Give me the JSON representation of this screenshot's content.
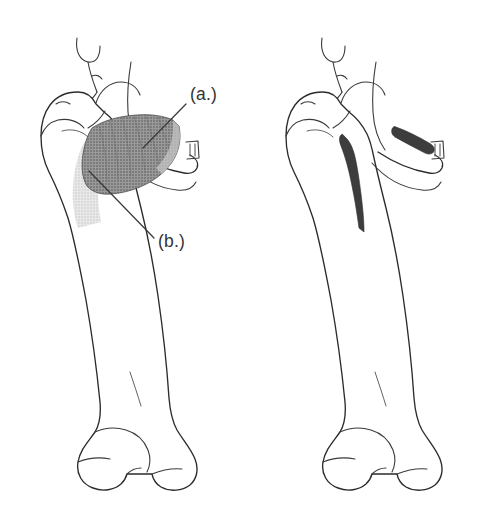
{
  "figure": {
    "background_color": "#ffffff",
    "outline_color": "#2b2b2b",
    "width": 491,
    "height": 521,
    "panels": [
      {
        "id": "left",
        "name": "muscle-view",
        "description": "Anterior view of right hip joint and femur with shaded adductor muscle",
        "callouts": [
          {
            "key": "a",
            "label": "(a.)",
            "label_x": 190,
            "label_y": 100,
            "leader_from_x": 186,
            "leader_from_y": 104,
            "leader_to_x": 143,
            "leader_to_y": 148,
            "target": "muscle-belly",
            "shade_color": "#8a8a8a"
          },
          {
            "key": "b",
            "label": "(b.)",
            "label_x": 158,
            "label_y": 247,
            "leader_from_x": 154,
            "leader_from_y": 238,
            "leader_to_x": 89,
            "leader_to_y": 171,
            "target": "muscle-tendon",
            "shade_color": "#d2d2d2"
          }
        ]
      },
      {
        "id": "right",
        "name": "attachment-view",
        "description": "Matching view of hip joint and femur showing bony origin and insertion sites in dark fill",
        "marks": [
          {
            "name": "origin-mark",
            "location": "inferior pubic ramus",
            "color": "#3d3d3d"
          },
          {
            "name": "insertion-mark",
            "location": "linea aspera of femur",
            "color": "#3d3d3d"
          }
        ]
      }
    ]
  },
  "colors": {
    "muscle_belly": "#8a8a8a",
    "muscle_tendon": "#d4d4d4",
    "attachment": "#3d3d3d",
    "outline": "#2b2b2b",
    "label_text": "#333333",
    "background": "#ffffff"
  }
}
